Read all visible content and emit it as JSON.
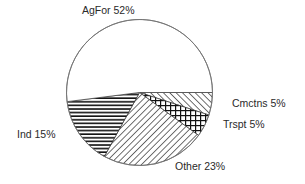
{
  "chart_data": {
    "type": "pie",
    "title": "",
    "categories": [
      "Cmctns",
      "Trspt",
      "Other",
      "Ind",
      "AgFor"
    ],
    "values": [
      5,
      5,
      23,
      15,
      52
    ],
    "unit": "%",
    "start_angle_deg": 0,
    "direction": "clockwise",
    "fills": [
      "diagonal-forward",
      "crosshatch",
      "diagonal-backward",
      "horizontal-lines",
      "white"
    ],
    "labels": {
      "AgFor": "AgFor 52%",
      "Cmctns": "Cmctns 5%",
      "Trspt": "Trspt 5%",
      "Other": "Other 23%",
      "Ind": "Ind 15%"
    },
    "legend": "none (direct labels)"
  },
  "colors": {
    "stroke": "#333333",
    "text": "#2a2a2a",
    "background": "#ffffff"
  }
}
